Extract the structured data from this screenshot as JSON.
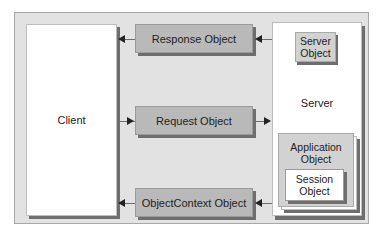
{
  "diagram": {
    "client": {
      "label": "Client"
    },
    "server": {
      "label": "Server",
      "server_object": {
        "label": "Server Object"
      },
      "application_object": {
        "label": "Application Object"
      },
      "session_object": {
        "label": "Session Object"
      }
    },
    "messages": [
      {
        "label": "Response Object",
        "direction": "server-to-client"
      },
      {
        "label": "Request Object",
        "direction": "client-to-server"
      },
      {
        "label": "ObjectContext Object",
        "direction": "server-to-client"
      }
    ],
    "colors": {
      "frame_fill": "#e2e2e2",
      "message_fill": "#b9b9b9",
      "container_fill": "#ffffff",
      "shadow": "#6e6e6e",
      "application_fill": "#d2d2d2"
    }
  }
}
